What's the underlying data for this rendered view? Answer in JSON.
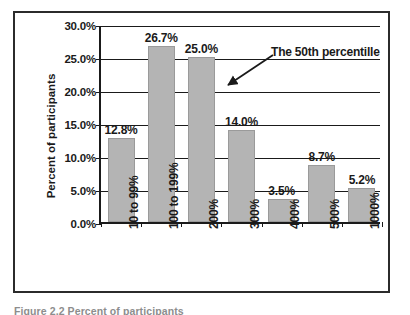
{
  "figure": {
    "caption": "Figure 2.2  Percent of participants"
  },
  "chart_data": {
    "type": "bar",
    "title": "",
    "xlabel": "",
    "ylabel": "Percent of participants",
    "categories": [
      "10 to 99%",
      "100 to 199%",
      "200%",
      "300%",
      "400%",
      "500%",
      "1000%"
    ],
    "values": [
      12.8,
      26.7,
      25.0,
      14.0,
      3.5,
      8.7,
      5.2
    ],
    "value_labels": [
      "12.8%",
      "26.7%",
      "25.0%",
      "14.0%",
      "3.5%",
      "8.7%",
      "5.2%"
    ],
    "ylim": [
      0,
      30
    ],
    "ytick_labels": [
      "0.0%",
      "5.0%",
      "10.0%",
      "15.0%",
      "20.0%",
      "25.0%",
      "30.0%"
    ],
    "ytick_values": [
      0,
      5,
      10,
      15,
      20,
      25,
      30
    ],
    "grid": true,
    "legend": "none",
    "bar_color": "#b4b4b4",
    "axis_color": "#1a1a1a",
    "annotations": [
      {
        "text": "The 50th percentille",
        "points_at_category": "200%",
        "arrow": true
      }
    ]
  }
}
